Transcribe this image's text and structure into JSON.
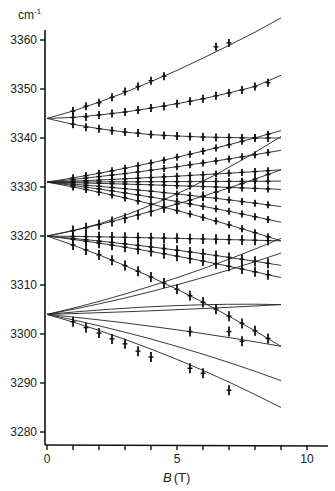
{
  "chart_data": {
    "type": "line",
    "title": "",
    "xlabel": "B (T)",
    "ylabel": "cm-1",
    "xlim": [
      0,
      10.5
    ],
    "ylim": [
      3278,
      3362
    ],
    "x_ticks": [
      0,
      5,
      10
    ],
    "x_minor_ticks": [
      1,
      2,
      3,
      4,
      6,
      7,
      8,
      9
    ],
    "y_ticks": [
      3280,
      3290,
      3300,
      3310,
      3320,
      3330,
      3340,
      3350,
      3360
    ],
    "y_tick_labels": [
      "3280",
      "3290",
      "3300",
      "3310",
      "3320",
      "3330",
      "3340",
      "3350",
      "3360"
    ],
    "grid": false,
    "legend": null,
    "series": [
      {
        "name": "group-3344-upper",
        "origin": 3344,
        "x": [
          0,
          1,
          2,
          3,
          4,
          5,
          6,
          7,
          8,
          9
        ],
        "fit": [
          3344,
          3345.5,
          3347.3,
          3349.3,
          3351.5,
          3353.8,
          3356.3,
          3358.9,
          3361.6,
          3364.5
        ],
        "points": [
          [
            1,
            3345.5
          ],
          [
            1.5,
            3346.5
          ],
          [
            2,
            3347.2
          ],
          [
            2.5,
            3348.3
          ],
          [
            3,
            3349.5
          ],
          [
            3.5,
            3350.5
          ],
          [
            4,
            3351.7
          ],
          [
            4.5,
            3352.6
          ],
          [
            6.5,
            3358.6
          ],
          [
            7,
            3359.4
          ]
        ]
      },
      {
        "name": "group-3344-middle",
        "origin": 3344,
        "x": [
          0,
          1,
          2,
          3,
          4,
          5,
          6,
          7,
          8,
          9
        ],
        "fit": [
          3344,
          3344.2,
          3344.7,
          3345.3,
          3346.1,
          3347,
          3348,
          3349.2,
          3350.5,
          3352.8
        ],
        "points": [
          [
            1,
            3344.2
          ],
          [
            1.5,
            3344.3
          ],
          [
            2,
            3344.7
          ],
          [
            2.5,
            3345
          ],
          [
            3,
            3345.3
          ],
          [
            3.5,
            3345.7
          ],
          [
            4,
            3346.1
          ],
          [
            4.5,
            3346.5
          ],
          [
            5,
            3347
          ],
          [
            5.5,
            3347.5
          ],
          [
            6,
            3348
          ],
          [
            6.5,
            3348.6
          ],
          [
            7,
            3349.2
          ],
          [
            7.5,
            3349.8
          ],
          [
            8,
            3350.5
          ],
          [
            8.5,
            3351.3
          ]
        ]
      },
      {
        "name": "group-3344-lower",
        "origin": 3344,
        "x": [
          0,
          1,
          2,
          3,
          4,
          5,
          6,
          7,
          8,
          9
        ],
        "fit": [
          3344,
          3342.8,
          3341.9,
          3341.2,
          3340.7,
          3340.4,
          3340.2,
          3340.1,
          3340,
          3340
        ],
        "points": [
          [
            1,
            3342.8
          ],
          [
            1.5,
            3342.2
          ],
          [
            2,
            3341.9
          ],
          [
            2.5,
            3341.5
          ],
          [
            3,
            3341.2
          ],
          [
            3.5,
            3341
          ],
          [
            4,
            3340.7
          ],
          [
            4.5,
            3340.5
          ],
          [
            5,
            3340.4
          ],
          [
            5.5,
            3340.3
          ],
          [
            6,
            3340.2
          ],
          [
            6.5,
            3340.1
          ],
          [
            7,
            3340.1
          ],
          [
            7.5,
            3340
          ],
          [
            8,
            3340
          ],
          [
            8.5,
            3340
          ]
        ]
      },
      {
        "name": "group-3331-fan",
        "origin": 3331,
        "x": [
          0,
          9
        ],
        "fit_endpoints": [
          3341.5,
          3337.5,
          3333.5,
          3331.2,
          3329.5,
          3326,
          3322.8,
          3319
        ],
        "points_B": [
          1,
          1.5,
          2,
          2.5,
          3,
          3.5,
          4,
          4.5,
          5,
          5.5,
          6,
          6.5,
          7,
          7.5,
          8,
          8.5
        ]
      },
      {
        "name": "group-3320-fan",
        "origin": 3320,
        "x": [
          0,
          9
        ],
        "fit_endpoints": [
          3333.5,
          3319,
          3314,
          3311.5,
          3297.5
        ],
        "points_B": [
          1,
          1.5,
          2,
          2.5,
          3,
          3.5,
          4,
          4.5,
          5,
          5.5,
          6,
          6.5,
          7,
          7.5,
          8,
          8.5
        ]
      },
      {
        "name": "group-3304-fan",
        "origin": 3304,
        "x": [
          0,
          9
        ],
        "fit_endpoints": [
          3319.5,
          3316.5,
          3306,
          3297.5,
          3290.5,
          3285
        ],
        "points": [
          [
            1,
            3302.5
          ],
          [
            1.5,
            3301.3
          ],
          [
            2,
            3300.2
          ],
          [
            2.5,
            3299
          ],
          [
            3,
            3298
          ],
          [
            3.5,
            3296.5
          ],
          [
            4,
            3295.3
          ],
          [
            5.5,
            3293
          ],
          [
            6,
            3292
          ],
          [
            7,
            3288.5
          ],
          [
            5.5,
            3300.5
          ],
          [
            7,
            3300.5
          ],
          [
            7.5,
            3298.5
          ]
        ]
      }
    ]
  },
  "axes": {
    "y_unit": "cm",
    "y_unit_exp": "-1",
    "x_label_var": "B",
    "x_label_unit": "(T)"
  }
}
